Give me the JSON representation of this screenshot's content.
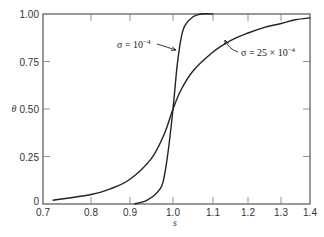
{
  "chart_data": {
    "type": "line",
    "title": "",
    "xlabel": "s",
    "ylabel": "θ",
    "xlim": [
      0.7,
      1.4
    ],
    "ylim": [
      0,
      1.0
    ],
    "grid": false,
    "legend": "none (inline annotations with arrows)",
    "x_ticks": [
      "0.7",
      "0.8",
      "0.9",
      "1.0",
      "1.1",
      "1.2",
      "1.3",
      "1.4"
    ],
    "y_ticks": [
      "0",
      "0.25",
      "0.50",
      "0.75",
      "1.00"
    ],
    "series": [
      {
        "name": "σ = 10^-4",
        "label_parts": {
          "prefix": "σ = 10",
          "sup": "−4"
        },
        "x": [
          0.91,
          0.94,
          0.97,
          0.98,
          0.99,
          1.0,
          1.01,
          1.02,
          1.03,
          1.05,
          1.07,
          1.1
        ],
        "y": [
          0.0,
          0.02,
          0.08,
          0.15,
          0.3,
          0.5,
          0.72,
          0.87,
          0.94,
          0.985,
          1.0,
          1.0
        ]
      },
      {
        "name": "σ = 25 × 10^-4",
        "label_parts": {
          "prefix": "σ = 25 × 10",
          "sup": "−4"
        },
        "x": [
          0.72,
          0.8,
          0.85,
          0.9,
          0.95,
          0.98,
          1.0,
          1.02,
          1.05,
          1.1,
          1.15,
          1.2,
          1.25,
          1.3,
          1.35,
          1.4
        ],
        "y": [
          0.02,
          0.05,
          0.08,
          0.13,
          0.24,
          0.37,
          0.5,
          0.6,
          0.7,
          0.8,
          0.86,
          0.9,
          0.93,
          0.95,
          0.97,
          0.98
        ]
      }
    ],
    "annotations": [
      {
        "text": "σ = 10^-4",
        "points_to": {
          "x": 1.01,
          "y": 0.82
        }
      },
      {
        "text": "σ = 25 × 10^-4",
        "points_to": {
          "x": 1.15,
          "y": 0.86
        }
      }
    ]
  },
  "axes": {
    "xlabel": "s",
    "ylabel": "θ"
  }
}
